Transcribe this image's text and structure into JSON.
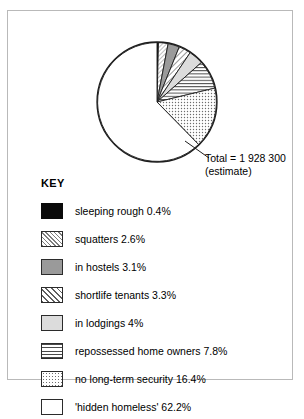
{
  "chart_data": {
    "type": "pie",
    "title": "",
    "annotation_total": "Total = 1 928 300",
    "annotation_estimate": "(estimate)",
    "legend_title": "KEY",
    "legend_position": "below",
    "units": "percent",
    "start_angle_deg": 0,
    "direction": "clockwise",
    "categories": [
      "sleeping rough",
      "squatters",
      "in hostels",
      "shortlife tenants",
      "in lodgings",
      "repossessed home owners",
      "no long-term security",
      "'hidden homeless'"
    ],
    "values": [
      0.4,
      2.6,
      3.1,
      3.3,
      4,
      7.8,
      16.4,
      62.2
    ],
    "slices": [
      {
        "label": "sleeping rough 0.4%",
        "name": "sleeping rough",
        "value": 0.4,
        "pattern": "solid-black",
        "swatch_class": "sw-solid-black"
      },
      {
        "label": "squatters 2.6%",
        "name": "squatters",
        "value": 2.6,
        "pattern": "diagonal-hatch-fine",
        "swatch_class": "sw-hatch-fine"
      },
      {
        "label": "in hostels 3.1%",
        "name": "in hostels",
        "value": 3.1,
        "pattern": "solid-gray",
        "swatch_class": "sw-gray-mid"
      },
      {
        "label": "shortlife tenants 3.3%",
        "name": "shortlife tenants",
        "value": 3.3,
        "pattern": "diagonal-hatch-bold",
        "swatch_class": "sw-hatch-bold"
      },
      {
        "label": "in lodgings 4%",
        "name": "in lodgings",
        "value": 4,
        "pattern": "solid-light-gray",
        "swatch_class": "sw-gray-light"
      },
      {
        "label": "repossessed home owners 7.8%",
        "name": "repossessed home owners",
        "value": 7.8,
        "pattern": "horizontal-lines",
        "swatch_class": "sw-hlines"
      },
      {
        "label": "no long-term security 16.4%",
        "name": "no long-term security",
        "value": 16.4,
        "pattern": "dots",
        "swatch_class": "sw-dots"
      },
      {
        "label": "'hidden homeless' 62.2%",
        "name": "'hidden homeless'",
        "value": 62.2,
        "pattern": "white",
        "swatch_class": "sw-white"
      }
    ]
  },
  "colors": {
    "outline": "#1d1d1d",
    "frame": "#b9b9b9",
    "black": "#0a0a0a",
    "gray_mid": "#9a9a9a",
    "gray_light": "#dcdcdc",
    "white": "#ffffff"
  }
}
